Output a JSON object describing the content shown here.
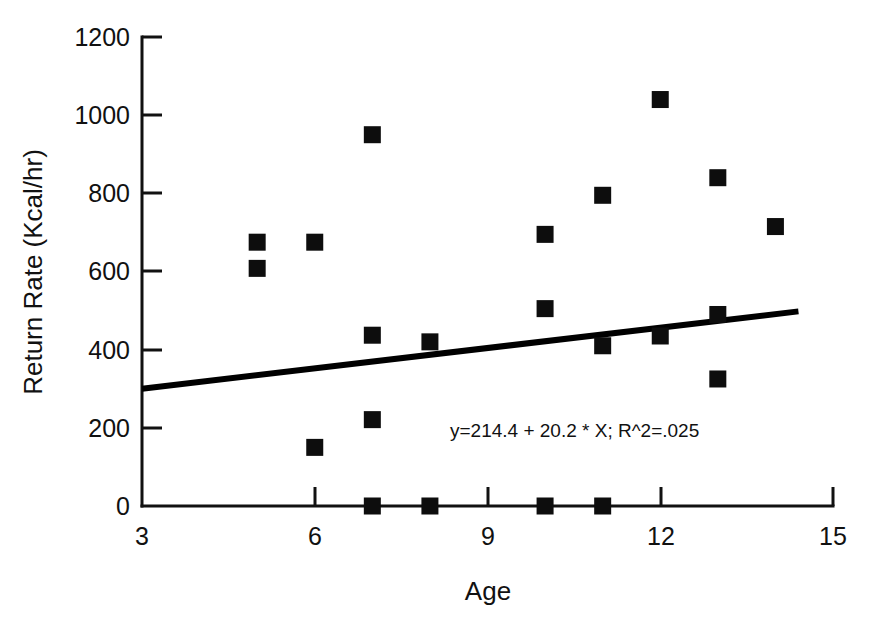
{
  "chart_data": {
    "type": "scatter",
    "title": "",
    "xlabel": "Age",
    "ylabel": "Return Rate (Kcal/hr)",
    "xlim": [
      3,
      15
    ],
    "ylim": [
      0,
      1200
    ],
    "xticks": [
      "3",
      "6",
      "9",
      "12",
      "15"
    ],
    "xtick_values": [
      3,
      6,
      9,
      12,
      15
    ],
    "yticks": [
      "0",
      "200",
      "400",
      "600",
      "800",
      "1000",
      "1200"
    ],
    "ytick_values": [
      0,
      200,
      400,
      600,
      800,
      1000,
      1200
    ],
    "grid": false,
    "legend": false,
    "marker_shape": "square",
    "marker_color": "#0d0d0d",
    "points": [
      {
        "x": 5,
        "y": 675
      },
      {
        "x": 5,
        "y": 608
      },
      {
        "x": 6,
        "y": 675
      },
      {
        "x": 6,
        "y": 150
      },
      {
        "x": 7,
        "y": 950
      },
      {
        "x": 7,
        "y": 437
      },
      {
        "x": 7,
        "y": 221
      },
      {
        "x": 7,
        "y": 0
      },
      {
        "x": 8,
        "y": 420
      },
      {
        "x": 8,
        "y": 0
      },
      {
        "x": 10,
        "y": 695
      },
      {
        "x": 10,
        "y": 505
      },
      {
        "x": 10,
        "y": 0
      },
      {
        "x": 11,
        "y": 795
      },
      {
        "x": 11,
        "y": 410
      },
      {
        "x": 11,
        "y": 0
      },
      {
        "x": 12,
        "y": 1040
      },
      {
        "x": 12,
        "y": 435
      },
      {
        "x": 13,
        "y": 840
      },
      {
        "x": 13,
        "y": 490
      },
      {
        "x": 13,
        "y": 325
      },
      {
        "x": 14,
        "y": 715
      }
    ],
    "fit_line": {
      "equation_text": "y=214.4 + 20.2 * X; R^2=.025",
      "intercept": 214.4,
      "slope": 20.2,
      "r_squared": 0.025,
      "x_start": 3,
      "x_end": 14.4,
      "y_start": 300,
      "y_end": 498
    }
  }
}
